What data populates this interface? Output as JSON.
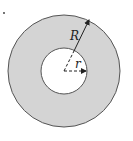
{
  "figure": {
    "marker": ".",
    "labels": {
      "outer_radius": "R",
      "inner_radius": "r"
    },
    "colors": {
      "annulus_fill": "#d4d4d4",
      "outline": "#555555",
      "hole_fill": "#ffffff",
      "arrow": "#222222"
    },
    "geometry": {
      "center": [
        64,
        71
      ],
      "outer_radius_px": 56,
      "inner_radius_px": 23
    }
  }
}
